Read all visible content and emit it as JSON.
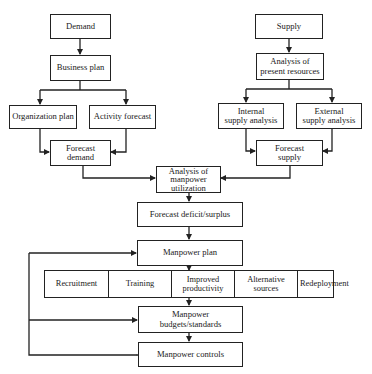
{
  "diagram": {
    "demand_side": {
      "demand": "Demand",
      "business_plan": "Business plan",
      "organization_plan": "Organization plan",
      "activity_forecast": "Activity forecast",
      "forecast_demand": [
        "Forecast",
        "demand"
      ]
    },
    "supply_side": {
      "supply": "Supply",
      "analysis_present_resources": [
        "Analysis of",
        "present resources"
      ],
      "internal_supply_analysis": [
        "Internal",
        "supply analysis"
      ],
      "external_supply_analysis": [
        "External",
        "supply analysis"
      ],
      "forecast_supply": [
        "Forecast",
        "supply"
      ]
    },
    "analysis_manpower_utilization": [
      "Analysis of",
      "manpower",
      "utilization"
    ],
    "forecast_deficit_surplus": "Forecast deficit/surplus",
    "manpower_plan": "Manpower plan",
    "actions": [
      [
        "Recruitment"
      ],
      [
        "Training"
      ],
      [
        "Improved",
        "productivity"
      ],
      [
        "Alternative",
        "sources"
      ],
      [
        "Redeployment"
      ]
    ],
    "manpower_budgets_standards": [
      "Manpower",
      "budgets/standards"
    ],
    "manpower_controls": "Manpower controls",
    "line_color": "#222222"
  }
}
